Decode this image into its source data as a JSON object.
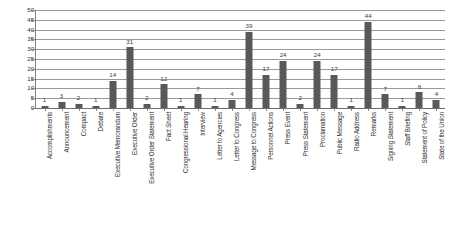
{
  "chart_data": {
    "type": "bar",
    "title": "",
    "subtitle": "",
    "xlabel": "",
    "ylabel": "",
    "ylim": [
      0,
      50
    ],
    "ytick_step": 5,
    "yticks": [
      50,
      45,
      40,
      35,
      30,
      25,
      20,
      15,
      10,
      5,
      0
    ],
    "grid": true,
    "legend": false,
    "legend_position": "none",
    "show_data_labels": true,
    "xtick_label_rotation": 90,
    "bar_color": "#595959",
    "gridline_color": "#9a9a9a",
    "axis_color": "#808080",
    "background_color": "#ffffff",
    "categories": [
      "Accomplishments",
      "Announcement",
      "Compact",
      "Debate",
      "Executive Memorandum",
      "Executive Order",
      "Executive Order Statement",
      "Fact Sheet",
      "Congressional Hearing",
      "Interview",
      "Letter to Agencies",
      "Letter to Congress",
      "Message to Congress",
      "Personnel Actions",
      "Press Event",
      "Press Statement",
      "Proclamation",
      "Public Message",
      "Radio Address",
      "Remarks",
      "Signing Statement",
      "Staff Briefing",
      "Statement of Policy",
      "State of the Union"
    ],
    "values": [
      1,
      3,
      2,
      1,
      14,
      31,
      2,
      12,
      1,
      7,
      1,
      4,
      39,
      17,
      24,
      2,
      24,
      17,
      1,
      44,
      7,
      1,
      8,
      4
    ]
  }
}
